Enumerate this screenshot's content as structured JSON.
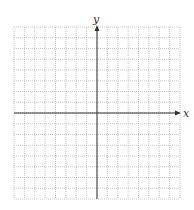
{
  "diagram": {
    "type": "coordinate-grid",
    "x_axis_label": "x",
    "y_axis_label": "y",
    "grid": {
      "columns": 16,
      "rows": 16,
      "left": 14,
      "top": 27,
      "right": 180,
      "bottom": 199,
      "line_color": "#b8b8b8",
      "line_style": "dotted"
    },
    "axes": {
      "origin_col": 8,
      "origin_row": 8,
      "color": "#333333"
    }
  }
}
